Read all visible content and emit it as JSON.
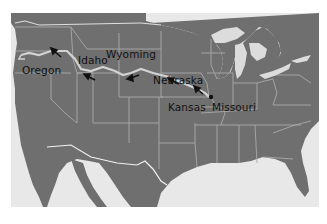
{
  "map": {
    "title": "Oregon Trail route map",
    "colors": {
      "land": "#6f6f6f",
      "water": "#e8e8e8",
      "borders": "#a9a9a9",
      "trail": "#cfcfcf",
      "arrows": "#111111"
    },
    "labels": [
      {
        "name": "Oregon",
        "x": 16,
        "y": 58
      },
      {
        "name": "Idaho",
        "x": 76,
        "y": 47
      },
      {
        "name": "Wyoming",
        "x": 106,
        "y": 40
      },
      {
        "name": "Nebraska",
        "x": 152,
        "y": 65
      },
      {
        "name": "Kansas",
        "x": 167,
        "y": 91
      },
      {
        "name": "Missouri",
        "x": 204,
        "y": 93
      }
    ],
    "start_point": "Missouri",
    "route": [
      "Missouri",
      "Kansas",
      "Nebraska",
      "Wyoming",
      "Idaho",
      "Oregon"
    ]
  }
}
